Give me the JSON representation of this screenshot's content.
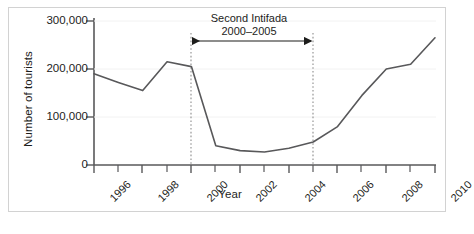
{
  "figure": {
    "frame_color": "#d2d2d2",
    "background": "#ffffff",
    "line_color": "#58585a",
    "text_color": "#1d1d1b",
    "axis_color": "#58585a",
    "guide_color": "#8c8c8c"
  },
  "chart_data": {
    "type": "line",
    "title": "",
    "xlabel": "Year",
    "ylabel": "Number of tourists",
    "x": [
      1996,
      1997,
      1998,
      1999,
      2000,
      2001,
      2002,
      2003,
      2004,
      2005,
      2006,
      2007,
      2008,
      2009,
      2010
    ],
    "values": [
      190000,
      172000,
      155000,
      215000,
      205000,
      40000,
      30000,
      27000,
      35000,
      48000,
      80000,
      145000,
      200000,
      210000,
      265000
    ],
    "series": [
      {
        "name": "Number of tourists",
        "values": [
          190000,
          172000,
          155000,
          215000,
          205000,
          40000,
          30000,
          27000,
          35000,
          48000,
          80000,
          145000,
          200000,
          210000,
          265000
        ]
      }
    ],
    "xlim": [
      1996,
      2010
    ],
    "ylim": [
      0,
      315000
    ],
    "ytick_values": [
      0,
      100000,
      200000,
      300000
    ],
    "ytick_labels": [
      "0",
      "100,000",
      "200,000",
      "300,000"
    ],
    "xtick_values": [
      1996,
      1998,
      2000,
      2002,
      2004,
      2006,
      2008,
      2010
    ],
    "xtick_labels": [
      "1996",
      "1998",
      "2000",
      "2002",
      "2004",
      "2006",
      "2008",
      "2010"
    ],
    "xminor_values": [
      1997,
      1999,
      2001,
      2003,
      2005,
      2007,
      2009
    ],
    "grid": false,
    "legend": null,
    "annotations": [
      {
        "name": "second-intifada-span",
        "label_line1": "Second Intifada",
        "label_line2": "2000–2005",
        "x_start": 2000,
        "x_end": 2005,
        "arrow": "double-headed",
        "guides": "dashed-vertical"
      }
    ]
  },
  "annotation": {
    "line1": "Second Intifada",
    "line2": "2000–2005"
  },
  "axes": {
    "x_title": "Year",
    "y_title": "Number of tourists"
  }
}
